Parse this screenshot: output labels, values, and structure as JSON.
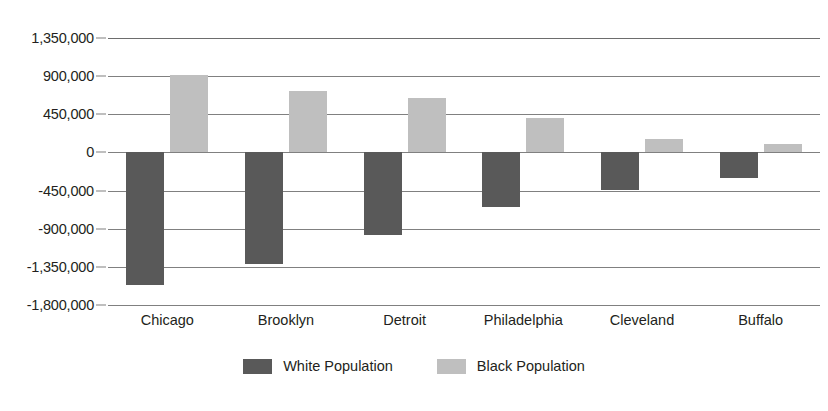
{
  "chart_data": {
    "type": "bar",
    "title": "",
    "subtitle": "",
    "xlabel": "",
    "ylabel": "",
    "categories": [
      "Chicago",
      "Brooklyn",
      "Detroit",
      "Philadelphia",
      "Cleveland",
      "Buffalo"
    ],
    "series": [
      {
        "name": "White Population",
        "color": "#595959",
        "values": [
          -1570000,
          -1320000,
          -970000,
          -646000,
          -438000,
          -300000
        ]
      },
      {
        "name": "Black Population",
        "color": "#bfbfbf",
        "values": [
          910000,
          721000,
          646000,
          404000,
          162000,
          104000
        ]
      }
    ],
    "ylim": [
      -1800000,
      1350000
    ],
    "ytick_values": [
      1350000,
      900000,
      450000,
      0,
      -450000,
      -900000,
      -1350000,
      -1800000
    ],
    "ytick_labels": [
      "1,350,000",
      "900,000",
      "450,000",
      "0",
      "-450,000",
      "-900,000",
      "-1,350,000",
      "-1,800,000"
    ],
    "grid": true,
    "legend_position": "bottom",
    "orientation": "vertical",
    "bar_mode": "grouped"
  },
  "legend": {
    "items": [
      {
        "label": "White Population",
        "swatch": "white-population-swatch"
      },
      {
        "label": "Black Population",
        "swatch": "black-population-swatch"
      }
    ]
  },
  "colors": {
    "white_population": "#595959",
    "black_population": "#bfbfbf",
    "gridline": "#808080",
    "text": "#231f20",
    "background": "#ffffff"
  }
}
